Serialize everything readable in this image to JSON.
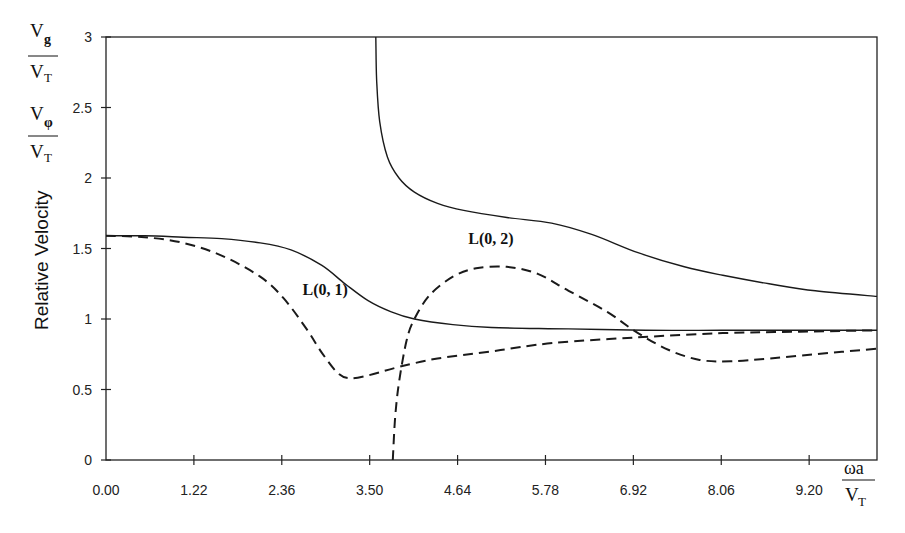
{
  "chart_data": {
    "type": "line",
    "title": "",
    "xlabel": "ωa / V_T",
    "ylabel": "Relative Velocity",
    "y_unit_labels": [
      {
        "num_main": "V",
        "num_sub": "g",
        "den_main": "V",
        "den_sub": "T"
      },
      {
        "num_main": "V",
        "num_sub": "φ",
        "den_main": "V",
        "den_sub": "T"
      }
    ],
    "x_unit_label": {
      "num": "ωa",
      "den_main": "V",
      "den_sub": "T"
    },
    "xlim": [
      0,
      10
    ],
    "ylim": [
      0,
      3
    ],
    "x_ticks": [
      0.0,
      1.14,
      2.28,
      3.42,
      4.56,
      5.7,
      6.84,
      7.98,
      9.12
    ],
    "x_tick_labels": [
      "0.00",
      "1.22",
      "2.36",
      "3.50",
      "4.64",
      "5.78",
      "6.92",
      "8.06",
      "9.20"
    ],
    "y_ticks": [
      0,
      0.5,
      1,
      1.5,
      2,
      2.5,
      3
    ],
    "y_tick_labels": [
      "0",
      "0.5",
      "1",
      "1.5",
      "2",
      "2.5",
      "3"
    ],
    "grid": false,
    "frame": "box",
    "annotations": [
      {
        "text": "L(0, 1)",
        "x": 2.55,
        "y": 1.17
      },
      {
        "text": "L(0, 2)",
        "x": 4.7,
        "y": 1.53
      }
    ],
    "series": [
      {
        "name": "L(0,1) phase velocity",
        "style": "solid",
        "x": [
          0.0,
          0.5,
          1.0,
          1.5,
          2.0,
          2.4,
          2.8,
          3.1,
          3.4,
          3.7,
          4.0,
          4.5,
          5.0,
          6.0,
          7.0,
          8.0,
          9.0,
          10.0
        ],
        "y": [
          1.59,
          1.59,
          1.58,
          1.57,
          1.54,
          1.49,
          1.38,
          1.25,
          1.13,
          1.05,
          1.0,
          0.96,
          0.94,
          0.93,
          0.92,
          0.92,
          0.92,
          0.92
        ]
      },
      {
        "name": "L(0,1) group velocity",
        "style": "dashed",
        "x": [
          0.0,
          0.5,
          1.0,
          1.5,
          2.0,
          2.3,
          2.6,
          2.8,
          3.0,
          3.15,
          3.4,
          3.8,
          4.3,
          5.0,
          5.8,
          6.9,
          8.0,
          9.0,
          10.0
        ],
        "y": [
          1.59,
          1.58,
          1.54,
          1.45,
          1.3,
          1.15,
          0.93,
          0.76,
          0.62,
          0.58,
          0.6,
          0.66,
          0.72,
          0.77,
          0.83,
          0.87,
          0.9,
          0.91,
          0.92
        ]
      },
      {
        "name": "L(0,2) phase velocity",
        "style": "solid",
        "x": [
          3.5,
          3.51,
          3.55,
          3.65,
          3.8,
          4.0,
          4.3,
          4.64,
          5.2,
          5.78,
          6.3,
          6.9,
          7.5,
          8.0,
          8.6,
          9.2,
          10.0
        ],
        "y": [
          3.0,
          2.7,
          2.4,
          2.15,
          2.0,
          1.9,
          1.82,
          1.77,
          1.72,
          1.68,
          1.6,
          1.47,
          1.37,
          1.31,
          1.25,
          1.2,
          1.16
        ]
      },
      {
        "name": "L(0,2) group velocity",
        "style": "dashed",
        "x": [
          3.72,
          3.75,
          3.8,
          3.9,
          4.0,
          4.2,
          4.5,
          4.8,
          5.2,
          5.6,
          6.0,
          6.5,
          6.9,
          7.3,
          7.7,
          8.1,
          8.6,
          9.2,
          10.0
        ],
        "y": [
          0.0,
          0.3,
          0.55,
          0.85,
          1.0,
          1.17,
          1.3,
          1.36,
          1.37,
          1.32,
          1.2,
          1.05,
          0.9,
          0.78,
          0.71,
          0.7,
          0.72,
          0.75,
          0.79
        ]
      }
    ]
  }
}
